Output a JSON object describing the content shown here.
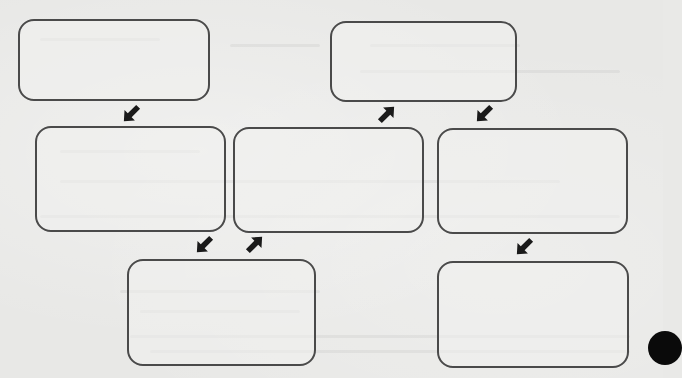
{
  "diagram": {
    "type": "flowchart",
    "colors": {
      "background": "#e8e8e6",
      "box_border": "#4a4a4a",
      "arrow": "#1a1a1a",
      "page_marker": "#0a0a0a"
    },
    "boxes": [
      {
        "id": "box-1",
        "label": ""
      },
      {
        "id": "box-2",
        "label": ""
      },
      {
        "id": "box-3",
        "label": ""
      },
      {
        "id": "box-4",
        "label": ""
      },
      {
        "id": "box-5",
        "label": ""
      },
      {
        "id": "box-6",
        "label": ""
      },
      {
        "id": "box-7",
        "label": ""
      }
    ],
    "arrows": [
      {
        "from": "box-1",
        "to": "box-2",
        "direction": "down-right"
      },
      {
        "from": "box-2",
        "to": "box-6",
        "direction": "down-right"
      },
      {
        "from": "box-6",
        "to": "box-3",
        "direction": "up-right"
      },
      {
        "from": "box-3",
        "to": "box-4",
        "direction": "up-right"
      },
      {
        "from": "box-4",
        "to": "box-5",
        "direction": "down-right"
      },
      {
        "from": "box-5",
        "to": "box-7",
        "direction": "down-right"
      }
    ]
  }
}
